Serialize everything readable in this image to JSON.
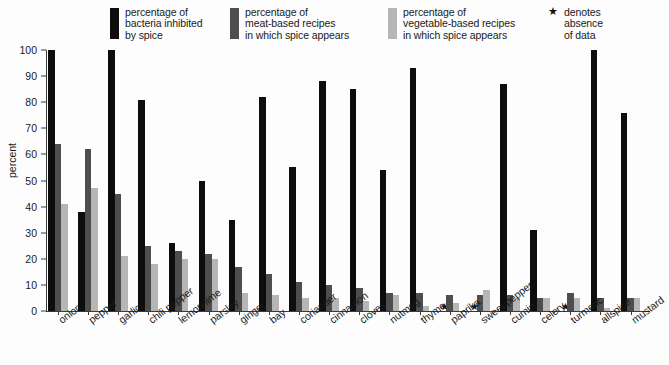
{
  "legend": {
    "items": [
      {
        "label": "percentage of\nbacteria inhibited\nby spice",
        "color": "#0d0d0d",
        "name": "legend-bacteria-inhibited"
      },
      {
        "label": "percentage of\nmeat-based recipes\nin which spice appears",
        "color": "#4e4e4e",
        "name": "legend-meat-recipes"
      },
      {
        "label": "percentage of\nvegetable-based recipes\nin which spice appears",
        "color": "#b6b6b6",
        "name": "legend-vegetable-recipes"
      }
    ],
    "note": {
      "symbol": "★",
      "label": "denotes\nabsence\nof data"
    }
  },
  "axes": {
    "ylabel": "percent",
    "yticks": [
      0,
      10,
      20,
      30,
      40,
      50,
      60,
      70,
      80,
      90,
      100
    ],
    "ylim": [
      0,
      100
    ]
  },
  "chart_data": {
    "type": "bar",
    "title": "",
    "xlabel": "",
    "ylabel": "percent",
    "ylim": [
      0,
      100
    ],
    "grid": false,
    "legend_position": "top",
    "categories": [
      "onion",
      "pepper",
      "garlic",
      "chili pepper",
      "lemon/lime",
      "parsley",
      "ginger",
      "bay",
      "coriander",
      "cinnamon",
      "cloves",
      "nutmeg",
      "thyme",
      "paprika",
      "sweet pepper",
      "cumin",
      "celery",
      "turmeric",
      "allspice",
      "mustard"
    ],
    "series": [
      {
        "name": "percentage of bacteria inhibited by spice",
        "color": "#0d0d0d",
        "values": [
          100,
          38,
          100,
          81,
          26,
          50,
          35,
          82,
          55,
          88,
          85,
          54,
          93,
          null,
          null,
          87,
          31,
          null,
          100,
          76
        ]
      },
      {
        "name": "percentage of meat-based recipes in which spice appears",
        "color": "#4e4e4e",
        "values": [
          64,
          62,
          45,
          25,
          23,
          22,
          17,
          14,
          11,
          10,
          9,
          7,
          7,
          6,
          6,
          6,
          5,
          7,
          5,
          5
        ]
      },
      {
        "name": "percentage of vegetable-based recipes in which spice appears",
        "color": "#b6b6b6",
        "values": [
          41,
          47,
          21,
          18,
          20,
          20,
          7,
          6,
          5,
          5,
          4,
          6,
          2,
          3,
          8,
          5,
          5,
          5,
          1,
          5
        ]
      }
    ],
    "absence_of_data_marker": "★",
    "absence_of_data_categories": [
      "paprika",
      "sweet pepper",
      "turmeric"
    ]
  }
}
